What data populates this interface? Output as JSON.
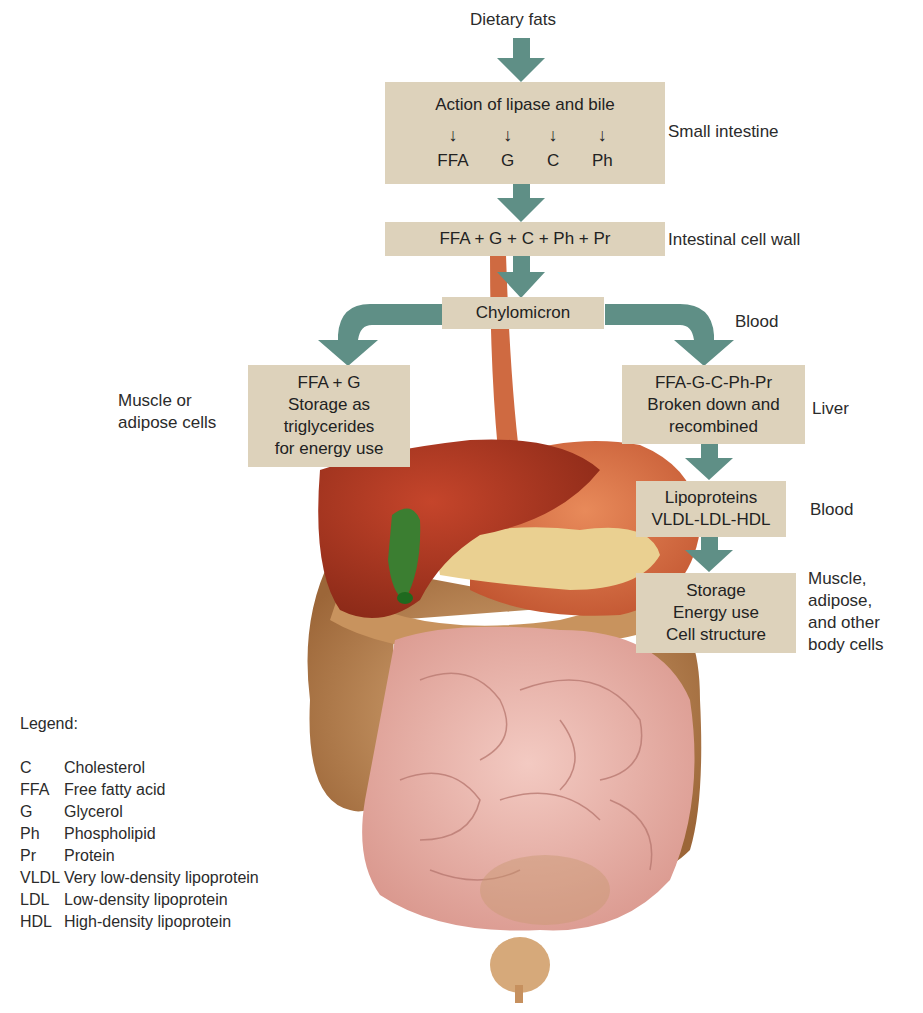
{
  "diagram": {
    "title": "Dietary fats",
    "boxes": {
      "lipase": {
        "heading": "Action of lipase and bile",
        "products": [
          "FFA",
          "G",
          "C",
          "Ph"
        ]
      },
      "cell_wall": {
        "text": "FFA + G + C + Ph + Pr"
      },
      "chylomicron": {
        "text": "Chylomicron"
      },
      "muscle_storage": {
        "lines": [
          "FFA + G",
          "Storage as",
          "triglycerides",
          "for energy use"
        ]
      },
      "liver": {
        "lines": [
          "FFA-G-C-Ph-Pr",
          "Broken down and",
          "recombined"
        ]
      },
      "lipoproteins": {
        "lines": [
          "Lipoproteins",
          "VLDL-LDL-HDL"
        ]
      },
      "body_cells": {
        "lines": [
          "Storage",
          "Energy use",
          "Cell structure"
        ]
      }
    },
    "side_labels": {
      "small_intestine": "Small intestine",
      "intestinal_cell_wall": "Intestinal cell wall",
      "blood_1": "Blood",
      "muscle_adipose": [
        "Muscle or",
        "adipose cells"
      ],
      "liver": "Liver",
      "blood_2": "Blood",
      "body_cells": [
        "Muscle,",
        "adipose,",
        "and other",
        "body cells"
      ]
    },
    "colors": {
      "arrow": "#5f8f86",
      "box": "#ddd2bb",
      "liver": "#a8331f",
      "colon": "#b98453",
      "small_intestine": "#e9b4ac",
      "pancreas": "#ecd39a",
      "gallbladder": "#2f7a2a",
      "esophagus": "#d0643c"
    }
  },
  "legend": {
    "title": "Legend:",
    "items": [
      {
        "abbr": "C",
        "term": "Cholesterol"
      },
      {
        "abbr": "FFA",
        "term": "Free fatty acid"
      },
      {
        "abbr": "G",
        "term": "Glycerol"
      },
      {
        "abbr": "Ph",
        "term": "Phospholipid"
      },
      {
        "abbr": "Pr",
        "term": "Protein"
      },
      {
        "abbr": "VLDL",
        "term": "Very low-density lipoprotein"
      },
      {
        "abbr": "LDL",
        "term": "Low-density lipoprotein"
      },
      {
        "abbr": "HDL",
        "term": "High-density lipoprotein"
      }
    ]
  }
}
